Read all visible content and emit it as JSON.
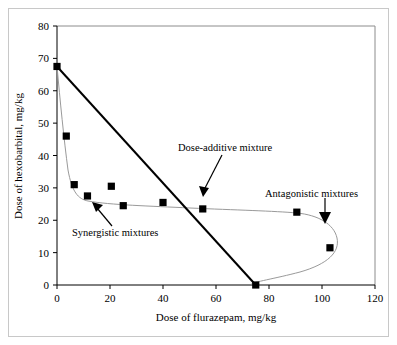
{
  "chart_data": {
    "type": "scatter",
    "title": "",
    "xlabel": "Dose of flurazepam, mg/kg",
    "ylabel": "Dose of hexobarbital, mg/kg",
    "xlim": [
      0,
      120
    ],
    "ylim": [
      0,
      80
    ],
    "xticks": [
      0,
      20,
      40,
      60,
      80,
      100,
      120
    ],
    "yticks": [
      0,
      10,
      20,
      30,
      40,
      50,
      60,
      70,
      80
    ],
    "xtick_labels": [
      "0",
      "20",
      "40",
      "60",
      "80",
      "100",
      "120"
    ],
    "ytick_labels": [
      "0",
      "10",
      "20",
      "30",
      "40",
      "50",
      "60",
      "70",
      "80"
    ],
    "grid": false,
    "legend": "none",
    "series": [
      {
        "name": "Experimental isobole (observed mixtures)",
        "type": "scatter-with-fitted-curve",
        "marker": "filled-square",
        "marker_color": "#000000",
        "curve_color": "#9a9a9a",
        "points": [
          {
            "x": 0,
            "y": 67.5
          },
          {
            "x": 3.5,
            "y": 46.0
          },
          {
            "x": 6.5,
            "y": 31.0
          },
          {
            "x": 11.5,
            "y": 27.5
          },
          {
            "x": 20.5,
            "y": 30.5
          },
          {
            "x": 25.0,
            "y": 24.5
          },
          {
            "x": 40.0,
            "y": 25.5
          },
          {
            "x": 55.0,
            "y": 23.5
          },
          {
            "x": 90.5,
            "y": 22.5
          },
          {
            "x": 103.0,
            "y": 11.5
          },
          {
            "x": 75.0,
            "y": 0.0
          }
        ]
      },
      {
        "name": "Dose-additive line (theoretical isobole)",
        "type": "line",
        "color": "#000000",
        "points": [
          {
            "x": 0,
            "y": 67.5
          },
          {
            "x": 75,
            "y": 0
          }
        ]
      }
    ],
    "annotations": [
      {
        "id": "dose-additive",
        "text": "Dose-additive mixture",
        "label_x": 46,
        "label_y": 42.5,
        "arrow_from": {
          "x": 42,
          "y": 38
        },
        "arrow_to": {
          "x": 55,
          "y": 27.5
        }
      },
      {
        "id": "synergistic",
        "text": "Synergistic mixtures",
        "label_x": 7,
        "label_y": 16.5,
        "arrow_from": {
          "x": 21,
          "y": 18
        },
        "arrow_to": {
          "x": 13.5,
          "y": 25
        }
      },
      {
        "id": "antagonistic",
        "text": "Antagonistic mixtures",
        "label_x": 79,
        "label_y": 29,
        "arrow_from": {
          "x": 101,
          "y": 26.5
        },
        "arrow_to": {
          "x": 101,
          "y": 19.5
        }
      }
    ]
  },
  "axes": {
    "x_title": "Dose of flurazepam, mg/kg",
    "y_title": "Dose of hexobarbital, mg/kg",
    "x_ticks": [
      "0",
      "20",
      "40",
      "60",
      "80",
      "100",
      "120"
    ],
    "y_ticks": [
      "0",
      "10",
      "20",
      "30",
      "40",
      "50",
      "60",
      "70",
      "80"
    ]
  },
  "annotations": {
    "dose_additive": "Dose-additive mixture",
    "synergistic": "Synergistic mixtures",
    "antagonistic": "Antagonistic mixtures"
  },
  "colors": {
    "axis": "#000000",
    "plot_border": "#8c8c8c",
    "iso_line": "#000000",
    "fitted_curve": "#9a9a9a",
    "marker": "#000000",
    "background": "#ffffff",
    "figure_frame": "#c8c8c8"
  }
}
